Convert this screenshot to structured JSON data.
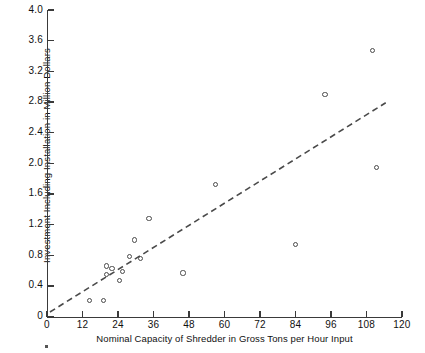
{
  "chart_data": {
    "type": "scatter",
    "title": "",
    "xlabel": "Nominal Capacity of Shredder in Gross Tons per Hour Input",
    "ylabel": "Investment Including Installation in Million Dollars",
    "xlim": [
      0,
      120
    ],
    "ylim": [
      0,
      4.0
    ],
    "xticks": [
      0,
      12,
      24,
      36,
      48,
      60,
      72,
      84,
      96,
      108,
      120
    ],
    "xtick_labels": [
      "0",
      "12",
      "24",
      "36",
      "48",
      "60",
      "72",
      "84",
      "96",
      "108",
      "120"
    ],
    "yticks": [
      0,
      0.4,
      0.8,
      1.2,
      1.6,
      2.0,
      2.4,
      2.8,
      3.2,
      3.6,
      4.0
    ],
    "ytick_labels": [
      "0",
      "0.4",
      "0.8",
      "1.2",
      "1.6",
      "2.0",
      "2.4",
      "2.8",
      "3.2",
      "3.6",
      "4.0"
    ],
    "grid": false,
    "legend": null,
    "marker": "open-circle",
    "points": [
      {
        "x": 14.5,
        "y": 0.21
      },
      {
        "x": 19.0,
        "y": 0.21
      },
      {
        "x": 22.0,
        "y": 0.63
      },
      {
        "x": 20.0,
        "y": 0.55
      },
      {
        "x": 20.0,
        "y": 0.66
      },
      {
        "x": 25.5,
        "y": 0.59
      },
      {
        "x": 24.5,
        "y": 0.47
      },
      {
        "x": 28.0,
        "y": 0.78
      },
      {
        "x": 29.5,
        "y": 1.0
      },
      {
        "x": 31.5,
        "y": 0.76
      },
      {
        "x": 34.5,
        "y": 1.28
      },
      {
        "x": 46.0,
        "y": 0.57
      },
      {
        "x": 57.0,
        "y": 1.72
      },
      {
        "x": 84.0,
        "y": 0.94
      },
      {
        "x": 94.0,
        "y": 2.9
      },
      {
        "x": 110.0,
        "y": 3.47
      },
      {
        "x": 111.5,
        "y": 1.95
      }
    ],
    "trend_line": {
      "style": "dashed",
      "x0": 1.0,
      "y0": 0.06,
      "x1": 114.5,
      "y1": 2.79
    }
  }
}
